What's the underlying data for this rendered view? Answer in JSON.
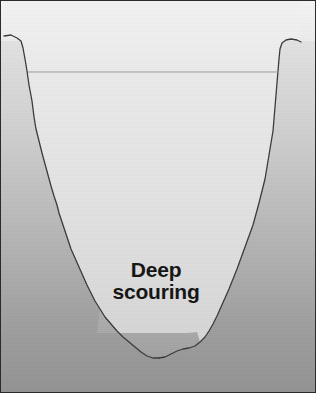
{
  "figure": {
    "kind": "geological-cross-section",
    "annotations": {
      "scour_label_line1": "Deep",
      "scour_label_line2": "scouring"
    },
    "frame": {
      "border_color": "#2b2b2b",
      "border_width_px": 1,
      "plate_width_px": 316,
      "plate_height_px": 393,
      "page_background": "#ffffff"
    },
    "palette": {
      "bedrock_top": "#ededed",
      "bedrock_bottom": "#8f8f8f",
      "valley_fill_top": "#f2f2f2",
      "valley_fill_bottom": "#d6d6d6",
      "scour_zone": "#a9a9a9",
      "outline_stroke": "#3a3a3a",
      "water_line": "#9a9a9a",
      "label_text": "#141414"
    },
    "features": [
      {
        "name": "bedrock-background",
        "label": "Surrounding bedrock",
        "description": "Graded grey mass filling the plate, darker toward the base"
      },
      {
        "name": "valley-fill",
        "label": "Valley cross profile",
        "description": "Pale U-shaped trough cut into the bedrock"
      },
      {
        "name": "valley-outline",
        "label": "Valley wall outline",
        "description": "Irregular dark line tracing the rock-valley contact"
      },
      {
        "name": "water-surface-line",
        "label": "Surface level line",
        "description": "Faint horizontal line spanning the trough near the rim"
      },
      {
        "name": "scour-zone",
        "label": "Deep scouring",
        "description": "Darker lens of sediment occupying the valley floor"
      }
    ],
    "geometry": {
      "water_line_y": 71,
      "water_line_x_start": 27,
      "water_line_x_end": 278,
      "valley_floor_y": 357,
      "scour_top_y": 332,
      "scour_left_x": 96,
      "scour_right_x": 186
    }
  }
}
